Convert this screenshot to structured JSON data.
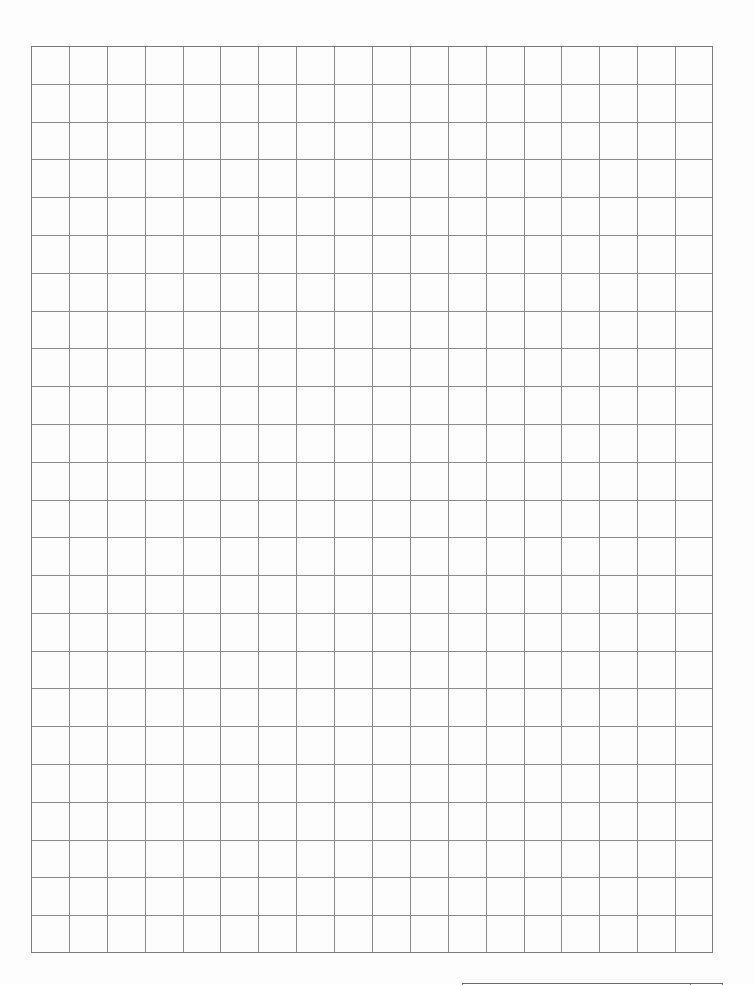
{
  "document": {
    "type": "grid-paper",
    "grid": {
      "columns": 18,
      "rows": 24,
      "left": 31,
      "top": 46,
      "width": 682,
      "height": 907,
      "line_color": "#8a8a8a",
      "border_color": "#7a7a7a"
    },
    "footer_box": {
      "left_cell_text": "",
      "right_cell_text": ""
    },
    "background_color": "#fdfdfd"
  }
}
